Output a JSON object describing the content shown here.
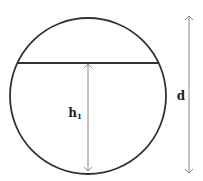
{
  "diagram": {
    "type": "circle-cross-section",
    "labels": {
      "height": "h",
      "height_subscript": "1",
      "diameter": "d"
    },
    "colors": {
      "outline": "#333333",
      "arrow": "#888888",
      "text": "#222222",
      "background": "#ffffff"
    },
    "geometry": {
      "circle": {
        "cx": 88,
        "cy": 96,
        "r": 78
      },
      "chord": {
        "x1": 18,
        "y1": 63,
        "x2": 158,
        "y2": 63
      },
      "height_arrow": {
        "x": 88,
        "y1": 63,
        "y2": 172
      },
      "diameter_arrow": {
        "x": 189,
        "y1": 15,
        "y2": 174
      }
    }
  }
}
